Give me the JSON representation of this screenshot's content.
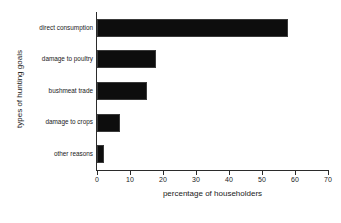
{
  "chart_data": {
    "type": "bar",
    "orientation": "horizontal",
    "title": "",
    "xlabel": "percentage of householders",
    "ylabel": "types of hunting goals",
    "categories": [
      "direct consumption",
      "damage to poultry",
      "bushmeat trade",
      "damage to crops",
      "other reasons"
    ],
    "values": [
      58,
      18,
      15,
      7,
      2
    ],
    "xlim": [
      0,
      70
    ],
    "xticks": [
      0,
      10,
      20,
      30,
      40,
      50,
      60,
      70
    ],
    "xtick_labels": [
      "0",
      "10",
      "20",
      "30",
      "40",
      "50",
      "60",
      "70"
    ],
    "grid": false,
    "legend": false,
    "bar_color": "#0d0d0d",
    "axis_color": "#2b2b2b",
    "background": "#ffffff"
  }
}
